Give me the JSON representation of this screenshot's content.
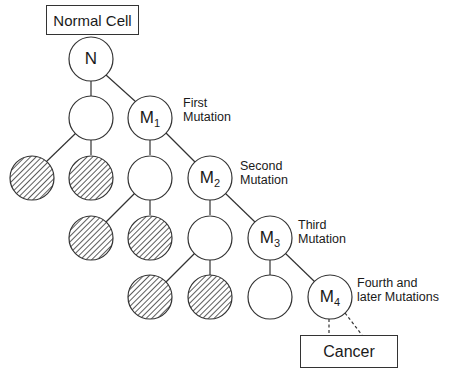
{
  "diagram": {
    "title_box": "Normal Cell",
    "result_box": "Cancer",
    "nodes": {
      "n": {
        "letter": "N",
        "sub": ""
      },
      "m1": {
        "letter": "M",
        "sub": "1"
      },
      "m2": {
        "letter": "M",
        "sub": "2"
      },
      "m3": {
        "letter": "M",
        "sub": "3"
      },
      "m4": {
        "letter": "M",
        "sub": "4"
      }
    },
    "annotations": {
      "first": "First\nMutation",
      "second": "Second\nMutation",
      "third": "Third\nMutation",
      "fourth": "Fourth and\nlater Mutations"
    },
    "legend_semantics": {
      "hatched_circle": "dead / non-dividing cell",
      "empty_circle": "normal daughter cell",
      "labeled_circle": "mutated cell lineage"
    }
  }
}
